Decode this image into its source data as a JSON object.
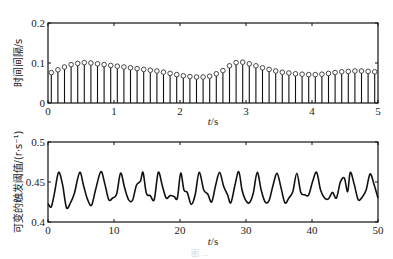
{
  "chart_data": [
    {
      "type": "stem",
      "title": "",
      "xlabel": "t/s",
      "ylabel": "时间间隔/s",
      "xlim": [
        0,
        5
      ],
      "ylim": [
        0,
        0.2
      ],
      "xticks": [
        0,
        1,
        2,
        3,
        4,
        5
      ],
      "xtick_labels": [
        "0",
        "1",
        "2",
        "3",
        "4",
        "5"
      ],
      "yticks": [
        0,
        0.1,
        0.2
      ],
      "ytick_labels": [
        "0",
        "0.1",
        "0.2"
      ],
      "grid": false,
      "marker": "open-circle",
      "x": [
        0.05,
        0.15,
        0.25,
        0.35,
        0.45,
        0.55,
        0.65,
        0.75,
        0.85,
        0.95,
        1.05,
        1.15,
        1.25,
        1.35,
        1.45,
        1.55,
        1.65,
        1.75,
        1.85,
        1.95,
        2.05,
        2.15,
        2.25,
        2.35,
        2.45,
        2.55,
        2.65,
        2.75,
        2.85,
        2.95,
        3.05,
        3.15,
        3.25,
        3.35,
        3.45,
        3.55,
        3.65,
        3.75,
        3.85,
        3.95,
        4.05,
        4.15,
        4.25,
        4.35,
        4.45,
        4.55,
        4.65,
        4.75,
        4.85,
        4.95
      ],
      "values": [
        0.076,
        0.083,
        0.09,
        0.096,
        0.099,
        0.101,
        0.1,
        0.098,
        0.096,
        0.094,
        0.092,
        0.09,
        0.088,
        0.086,
        0.084,
        0.082,
        0.08,
        0.077,
        0.074,
        0.071,
        0.068,
        0.066,
        0.065,
        0.065,
        0.067,
        0.073,
        0.081,
        0.093,
        0.101,
        0.102,
        0.098,
        0.093,
        0.088,
        0.084,
        0.08,
        0.077,
        0.075,
        0.073,
        0.072,
        0.071,
        0.071,
        0.072,
        0.074,
        0.076,
        0.078,
        0.079,
        0.08,
        0.08,
        0.079,
        0.078,
        0.077,
        0.076,
        0.075
      ]
    },
    {
      "type": "line",
      "title": "",
      "xlabel": "t/s",
      "ylabel": "可变的触发阈值/(r·s⁻¹)",
      "xlim": [
        0,
        50
      ],
      "ylim": [
        0.4,
        0.5
      ],
      "xticks": [
        0,
        10,
        20,
        30,
        40,
        50
      ],
      "xtick_labels": [
        "0",
        "10",
        "20",
        "30",
        "40",
        "50"
      ],
      "yticks": [
        0.4,
        0.45,
        0.5
      ],
      "ytick_labels": [
        "0.4",
        "0.45",
        "0.5"
      ],
      "grid": false,
      "x": [
        0,
        0.5,
        1.0,
        1.6,
        2.2,
        2.8,
        3.4,
        4.0,
        4.8,
        5.4,
        6.0,
        6.6,
        7.2,
        8.0,
        8.6,
        9.2,
        9.8,
        10.4,
        11.0,
        11.6,
        12.2,
        12.8,
        13.4,
        14.0,
        14.4,
        14.9,
        15.5,
        16.1,
        16.7,
        17.3,
        17.9,
        18.5,
        19.1,
        19.6,
        20.1,
        20.6,
        21.1,
        21.7,
        22.3,
        22.9,
        23.6,
        24.2,
        24.8,
        25.4,
        26.0,
        26.6,
        27.2,
        27.7,
        28.3,
        28.9,
        29.4,
        29.9,
        30.5,
        31.1,
        31.7,
        32.3,
        32.9,
        33.5,
        34.1,
        34.7,
        35.3,
        35.9,
        36.5,
        37.1,
        37.7,
        38.3,
        38.9,
        39.5,
        40.1,
        40.7,
        41.3,
        41.9,
        42.5,
        43.1,
        43.7,
        44.3,
        44.9,
        45.4,
        45.8,
        46.4,
        47.0,
        47.6,
        48.2,
        48.8,
        49.4,
        50.0
      ],
      "values": [
        0.423,
        0.419,
        0.437,
        0.462,
        0.447,
        0.418,
        0.424,
        0.436,
        0.462,
        0.445,
        0.428,
        0.421,
        0.44,
        0.463,
        0.448,
        0.428,
        0.43,
        0.435,
        0.461,
        0.443,
        0.428,
        0.427,
        0.446,
        0.451,
        0.462,
        0.436,
        0.433,
        0.428,
        0.462,
        0.446,
        0.43,
        0.433,
        0.432,
        0.43,
        0.461,
        0.44,
        0.437,
        0.422,
        0.434,
        0.462,
        0.44,
        0.435,
        0.425,
        0.446,
        0.462,
        0.445,
        0.434,
        0.424,
        0.445,
        0.463,
        0.44,
        0.428,
        0.424,
        0.436,
        0.462,
        0.44,
        0.425,
        0.427,
        0.446,
        0.461,
        0.443,
        0.424,
        0.43,
        0.438,
        0.461,
        0.437,
        0.434,
        0.434,
        0.451,
        0.462,
        0.44,
        0.43,
        0.429,
        0.437,
        0.43,
        0.45,
        0.455,
        0.438,
        0.462,
        0.447,
        0.428,
        0.431,
        0.44,
        0.46,
        0.447,
        0.43
      ]
    }
  ],
  "caption": "图 ..."
}
